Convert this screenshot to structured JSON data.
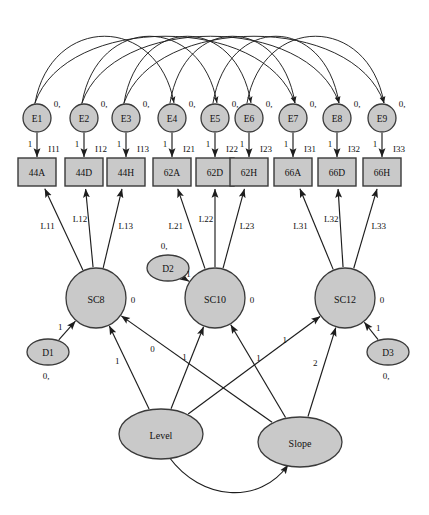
{
  "diagram": {
    "type": "sem-path-diagram",
    "colors": {
      "node_fill": "#c9c9c9",
      "node_stroke": "#3a3a3a",
      "edge": "#1d1d1d",
      "background": "#ffffff",
      "text": "#111111"
    }
  },
  "errors": {
    "mean_label": "0,",
    "loading_label": "1",
    "nodes": [
      {
        "id": "E1",
        "label": "E1",
        "cx": 37,
        "cy": 118,
        "r": 14
      },
      {
        "id": "E2",
        "label": "E2",
        "cx": 84,
        "cy": 118,
        "r": 14
      },
      {
        "id": "E3",
        "label": "E3",
        "cx": 126,
        "cy": 118,
        "r": 14
      },
      {
        "id": "E4",
        "label": "E4",
        "cx": 172,
        "cy": 118,
        "r": 14
      },
      {
        "id": "E5",
        "label": "E5",
        "cx": 215,
        "cy": 118,
        "r": 14
      },
      {
        "id": "E6",
        "label": "E6",
        "cx": 249,
        "cy": 118,
        "r": 14
      },
      {
        "id": "E7",
        "label": "E7",
        "cx": 293,
        "cy": 118,
        "r": 14
      },
      {
        "id": "E8",
        "label": "E8",
        "cx": 337,
        "cy": 118,
        "r": 14
      },
      {
        "id": "E9",
        "label": "E9",
        "cx": 382,
        "cy": 118,
        "r": 14
      }
    ]
  },
  "indicators": {
    "nodes": [
      {
        "id": "I11",
        "label": "44A",
        "intercept": "I11",
        "cx": 37,
        "cy": 172,
        "w": 38,
        "h": 28
      },
      {
        "id": "I12",
        "label": "44D",
        "intercept": "I12",
        "cx": 84,
        "cy": 172,
        "w": 38,
        "h": 28
      },
      {
        "id": "I13",
        "label": "44H",
        "intercept": "I13",
        "cx": 126,
        "cy": 172,
        "w": 38,
        "h": 28
      },
      {
        "id": "I21",
        "label": "62A",
        "intercept": "I21",
        "cx": 172,
        "cy": 172,
        "w": 38,
        "h": 28
      },
      {
        "id": "I22",
        "label": "62D",
        "intercept": "I22",
        "cx": 215,
        "cy": 172,
        "w": 38,
        "h": 28
      },
      {
        "id": "I23",
        "label": "62H",
        "intercept": "I23",
        "cx": 249,
        "cy": 172,
        "w": 38,
        "h": 28
      },
      {
        "id": "I31",
        "label": "66A",
        "intercept": "I31",
        "cx": 293,
        "cy": 172,
        "w": 38,
        "h": 28
      },
      {
        "id": "I32",
        "label": "66D",
        "intercept": "I32",
        "cx": 337,
        "cy": 172,
        "w": 38,
        "h": 28
      },
      {
        "id": "I33",
        "label": "66H",
        "intercept": "I33",
        "cx": 382,
        "cy": 172,
        "w": 38,
        "h": 28
      }
    ]
  },
  "latent_states": {
    "mean_label": "0",
    "nodes": [
      {
        "id": "SC8",
        "label": "SC8",
        "cx": 96,
        "cy": 298,
        "r": 30
      },
      {
        "id": "SC10",
        "label": "SC10",
        "cx": 215,
        "cy": 298,
        "r": 30
      },
      {
        "id": "SC12",
        "label": "SC12",
        "cx": 345,
        "cy": 298,
        "r": 30
      }
    ]
  },
  "disturbances": {
    "mean_label": "0,",
    "loading_label": "1",
    "nodes": [
      {
        "id": "D1",
        "label": "D1",
        "cx": 48,
        "cy": 352,
        "rx": 21,
        "ry": 13
      },
      {
        "id": "D2",
        "label": "D2",
        "cx": 168,
        "cy": 268,
        "rx": 21,
        "ry": 13
      },
      {
        "id": "D3",
        "label": "D3",
        "cx": 388,
        "cy": 352,
        "rx": 21,
        "ry": 13
      }
    ]
  },
  "growth_factors": {
    "nodes": [
      {
        "id": "Level",
        "label": "Level",
        "cx": 161,
        "cy": 434,
        "rx": 42,
        "ry": 25
      },
      {
        "id": "Slope",
        "label": "Slope",
        "cx": 300,
        "cy": 442,
        "rx": 42,
        "ry": 25
      }
    ],
    "covariance_label": ""
  },
  "loadings": {
    "SC8": [
      {
        "to": "I11",
        "label": "L11"
      },
      {
        "to": "I12",
        "label": "L12"
      },
      {
        "to": "I13",
        "label": "L13"
      }
    ],
    "SC10": [
      {
        "to": "I21",
        "label": "L21"
      },
      {
        "to": "I22",
        "label": "L22"
      },
      {
        "to": "I23",
        "label": "L23"
      }
    ],
    "SC12": [
      {
        "to": "I31",
        "label": "L31"
      },
      {
        "to": "I32",
        "label": "L32"
      },
      {
        "to": "I33",
        "label": "L33"
      }
    ]
  },
  "growth_paths": [
    {
      "from": "Level",
      "to": "SC8",
      "label": "1"
    },
    {
      "from": "Level",
      "to": "SC10",
      "label": "1"
    },
    {
      "from": "Level",
      "to": "SC12",
      "label": "1"
    },
    {
      "from": "Slope",
      "to": "SC8",
      "label": "0"
    },
    {
      "from": "Slope",
      "to": "SC10",
      "label": "1"
    },
    {
      "from": "Slope",
      "to": "SC12",
      "label": "2"
    }
  ],
  "error_correlations": [
    {
      "from": "E1",
      "to": "E4"
    },
    {
      "from": "E1",
      "to": "E7"
    },
    {
      "from": "E4",
      "to": "E7"
    },
    {
      "from": "E2",
      "to": "E5"
    },
    {
      "from": "E2",
      "to": "E8"
    },
    {
      "from": "E5",
      "to": "E8"
    },
    {
      "from": "E3",
      "to": "E6"
    },
    {
      "from": "E3",
      "to": "E9"
    },
    {
      "from": "E6",
      "to": "E9"
    }
  ]
}
